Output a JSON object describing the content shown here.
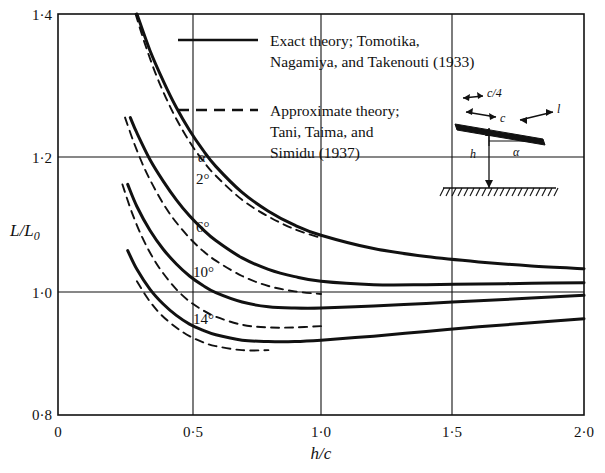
{
  "figure": {
    "background": "#ffffff",
    "ink": "#111111"
  },
  "axes": {
    "y_label": "L/L",
    "y_label_sub": "0",
    "x_label": "h/c",
    "y_ticks": [
      "1·4",
      "1·2",
      "1·0",
      "0·8"
    ],
    "x_ticks": [
      "0",
      "0·5",
      "1·0",
      "1·5",
      "2·0"
    ]
  },
  "legend": {
    "entries": [
      {
        "style": "solid",
        "line1": "Exact theory; Tomotika,",
        "line2": "Nagamiya, and Takenouti (1933)"
      },
      {
        "style": "dashed",
        "line1": "Approximate theory;",
        "line2": "Tani, Taima, and",
        "line3": "Simidu (1937)"
      }
    ]
  },
  "curve_labels": {
    "alpha_symbol": "α",
    "values": [
      "2°",
      "6°",
      "10°",
      "14°"
    ]
  },
  "inset": {
    "chord_quarter": "c/4",
    "chord": "c",
    "lift": "l",
    "height": "h",
    "angle": "α"
  },
  "chart_data": {
    "type": "line",
    "title": "",
    "xlabel": "h/c",
    "ylabel": "L/L0",
    "xlim": [
      0.0,
      2.0
    ],
    "ylim": [
      0.8,
      1.4
    ],
    "xticks": [
      0.0,
      0.5,
      1.0,
      1.5,
      2.0
    ],
    "yticks": [
      0.8,
      1.0,
      1.2,
      1.4
    ],
    "grid": true,
    "legend_position": "top-center",
    "series": [
      {
        "name": "Exact theory, alpha = 2°",
        "style": "solid",
        "label": "2°",
        "x": [
          0.3,
          0.35,
          0.4,
          0.45,
          0.5,
          0.55,
          0.6,
          0.7,
          0.8,
          0.9,
          1.0,
          1.2,
          1.4,
          1.6,
          1.8,
          2.0
        ],
        "y": [
          1.4,
          1.345,
          1.3,
          1.26,
          1.226,
          1.197,
          1.172,
          1.133,
          1.105,
          1.084,
          1.069,
          1.049,
          1.037,
          1.029,
          1.023,
          1.019
        ]
      },
      {
        "name": "Approximate theory, alpha = 2°",
        "style": "dashed",
        "x": [
          0.295,
          0.33,
          0.37,
          0.41,
          0.45,
          0.5,
          0.55,
          0.6,
          0.7,
          0.8,
          0.9,
          1.0
        ],
        "y": [
          1.4,
          1.356,
          1.312,
          1.275,
          1.243,
          1.209,
          1.181,
          1.158,
          1.122,
          1.097,
          1.078,
          1.065
        ]
      },
      {
        "name": "Exact theory, alpha = 6°",
        "style": "solid",
        "label": "6°",
        "x": [
          0.275,
          0.3,
          0.35,
          0.4,
          0.45,
          0.5,
          0.55,
          0.6,
          0.7,
          0.8,
          0.9,
          1.0,
          1.2,
          1.4,
          1.6,
          1.8,
          2.0
        ],
        "y": [
          1.245,
          1.222,
          1.182,
          1.15,
          1.122,
          1.098,
          1.078,
          1.061,
          1.035,
          1.018,
          1.007,
          1.0,
          0.995,
          0.995,
          0.996,
          0.997,
          0.998
        ]
      },
      {
        "name": "Approximate theory, alpha = 6°",
        "style": "dashed",
        "x": [
          0.255,
          0.29,
          0.33,
          0.37,
          0.41,
          0.45,
          0.5,
          0.55,
          0.6,
          0.7,
          0.8,
          0.9,
          1.0
        ],
        "y": [
          1.245,
          1.206,
          1.168,
          1.137,
          1.11,
          1.088,
          1.065,
          1.046,
          1.031,
          1.008,
          0.993,
          0.985,
          0.981
        ]
      },
      {
        "name": "Exact theory, alpha = 10°",
        "style": "solid",
        "label": "10°",
        "x": [
          0.265,
          0.3,
          0.35,
          0.4,
          0.45,
          0.5,
          0.55,
          0.6,
          0.7,
          0.8,
          0.9,
          1.0,
          1.2,
          1.4,
          1.6,
          1.8,
          2.0
        ],
        "y": [
          1.145,
          1.112,
          1.076,
          1.048,
          1.026,
          1.008,
          0.994,
          0.983,
          0.969,
          0.962,
          0.96,
          0.96,
          0.963,
          0.967,
          0.971,
          0.975,
          0.979
        ]
      },
      {
        "name": "Approximate theory, alpha = 10°",
        "style": "dashed",
        "x": [
          0.245,
          0.28,
          0.32,
          0.36,
          0.4,
          0.45,
          0.5,
          0.55,
          0.6,
          0.7,
          0.8,
          0.9,
          1.0
        ],
        "y": [
          1.145,
          1.104,
          1.066,
          1.036,
          1.012,
          0.988,
          0.97,
          0.957,
          0.947,
          0.935,
          0.931,
          0.931,
          0.933
        ]
      },
      {
        "name": "Exact theory, alpha = 14°",
        "style": "solid",
        "label": "14°",
        "x": [
          0.265,
          0.3,
          0.35,
          0.4,
          0.45,
          0.5,
          0.55,
          0.6,
          0.7,
          0.8,
          0.9,
          1.0,
          1.2,
          1.4,
          1.6,
          1.8,
          2.0
        ],
        "y": [
          1.046,
          1.018,
          0.988,
          0.966,
          0.949,
          0.936,
          0.927,
          0.92,
          0.912,
          0.91,
          0.91,
          0.912,
          0.918,
          0.925,
          0.932,
          0.938,
          0.944
        ]
      },
      {
        "name": "Approximate theory, alpha = 14°",
        "style": "dashed",
        "x": [
          0.3,
          0.34,
          0.38,
          0.42,
          0.46,
          0.5,
          0.55,
          0.6,
          0.7,
          0.8
        ],
        "y": [
          1.0,
          0.975,
          0.955,
          0.94,
          0.928,
          0.918,
          0.909,
          0.903,
          0.897,
          0.897
        ]
      }
    ]
  }
}
